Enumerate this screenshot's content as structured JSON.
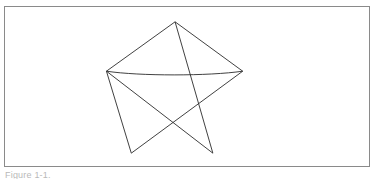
{
  "page": {
    "background_color": "#ffffff",
    "width": 376,
    "height": 179
  },
  "figure": {
    "frame": {
      "border_color": "#8a8a8a",
      "border_width": 1,
      "background_color": "#ffffff",
      "x": 4,
      "y": 6,
      "width": 366,
      "height": 161
    },
    "drawing": {
      "name": "five-pointed-star",
      "description": "Hand-drawn five pointed star (pentagram) traced as one continuous stroke",
      "stroke_color": "#2b2b2b",
      "stroke_width": 0.9,
      "fill": "none",
      "closed": true,
      "point_count": 5,
      "vertices": [
        {
          "label": "top-point",
          "x": 171.0,
          "y": 15.0
        },
        {
          "label": "right-arm-point",
          "x": 239.0,
          "y": 65.0
        },
        {
          "label": "bottom-left-point",
          "x": 127.0,
          "y": 148.0
        },
        {
          "label": "left-arm-point",
          "x": 102.0,
          "y": 65.0
        },
        {
          "label": "bottom-right-point",
          "x": 209.0,
          "y": 148.0
        }
      ],
      "path": "M 171,15 L 239,65 L 127,148 L 102,65 Q 170,70 239,65 M 102,65 L 209,148 L 171,15"
    },
    "caption": "Figure 1-1."
  }
}
